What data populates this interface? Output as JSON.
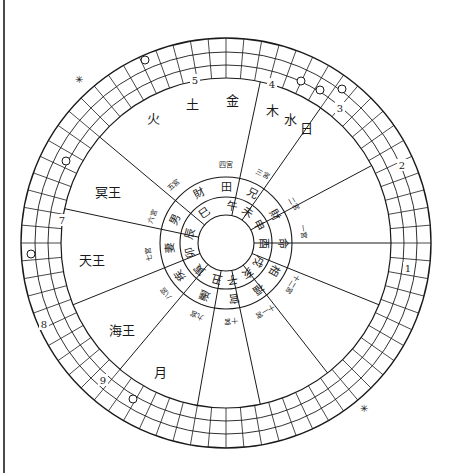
{
  "chart": {
    "title": "",
    "center": {
      "x": 226,
      "y": 243
    },
    "radii": {
      "hole": 28,
      "branch_ring": 46,
      "palace_ring": 66,
      "grid_inner": 165,
      "grid_mid1": 178,
      "grid_mid2": 191,
      "grid_outer": 205
    },
    "grid_divisions": 72,
    "spoke_angles_deg": [
      -78,
      -55,
      -28,
      0,
      22,
      52,
      78,
      100,
      130,
      158,
      192,
      220
    ],
    "branches": [
      {
        "label": "午",
        "angle": -80
      },
      {
        "label": "未",
        "angle": -55
      },
      {
        "label": "申",
        "angle": -28
      },
      {
        "label": "酉",
        "angle": 0
      },
      {
        "label": "戌",
        "angle": 30
      },
      {
        "label": "亥",
        "angle": 55
      },
      {
        "label": "子",
        "angle": 80
      },
      {
        "label": "丑",
        "angle": 105
      },
      {
        "label": "寅",
        "angle": 135
      },
      {
        "label": "卯",
        "angle": 165
      },
      {
        "label": "辰",
        "angle": 195
      },
      {
        "label": "巳",
        "angle": 235
      }
    ],
    "palaces": [
      {
        "label": "命",
        "angle": 0
      },
      {
        "label": "相",
        "angle": 30
      },
      {
        "label": "福",
        "angle": 55
      },
      {
        "label": "官",
        "angle": 82
      },
      {
        "label": "遷",
        "angle": 112
      },
      {
        "label": "疾",
        "angle": 145
      },
      {
        "label": "妻",
        "angle": 175
      },
      {
        "label": "男",
        "angle": 205
      },
      {
        "label": "財",
        "angle": -118
      },
      {
        "label": "田",
        "angle": -90
      },
      {
        "label": "兄",
        "angle": -62
      },
      {
        "label": "財",
        "angle": -30
      }
    ],
    "house_numbers": [
      {
        "label": "一宮",
        "angle": -8
      },
      {
        "label": "十二宮",
        "angle": 32
      },
      {
        "label": "十一宮",
        "angle": 60
      },
      {
        "label": "十宮",
        "angle": 86
      },
      {
        "label": "九宮",
        "angle": 112
      },
      {
        "label": "八宮",
        "angle": 140
      },
      {
        "label": "七宮",
        "angle": 172
      },
      {
        "label": "六宮",
        "angle": 200
      },
      {
        "label": "五宮",
        "angle": 228
      },
      {
        "label": "四宮",
        "angle": -90
      },
      {
        "label": "三宮",
        "angle": -62
      },
      {
        "label": "二宮",
        "angle": -30
      }
    ],
    "planets": [
      {
        "label": "火",
        "x": 153,
        "y": 118
      },
      {
        "label": "土",
        "x": 192,
        "y": 104
      },
      {
        "label": "金",
        "x": 232,
        "y": 100
      },
      {
        "label": "木",
        "x": 272,
        "y": 110
      },
      {
        "label": "水",
        "x": 290,
        "y": 119
      },
      {
        "label": "日",
        "x": 306,
        "y": 128
      },
      {
        "label": "冥王",
        "x": 108,
        "y": 192
      },
      {
        "label": "天王",
        "x": 92,
        "y": 260
      },
      {
        "label": "海王",
        "x": 122,
        "y": 330
      },
      {
        "label": "月",
        "x": 160,
        "y": 372
      }
    ],
    "grid_numbers": [
      {
        "label": "5",
        "x": 195,
        "y": 80
      },
      {
        "label": "4",
        "x": 272,
        "y": 84
      },
      {
        "label": "3",
        "x": 340,
        "y": 108
      },
      {
        "label": "2",
        "x": 402,
        "y": 165
      },
      {
        "label": "7",
        "x": 62,
        "y": 220
      },
      {
        "label": "8",
        "x": 44,
        "y": 324
      },
      {
        "label": "9",
        "x": 103,
        "y": 380
      },
      {
        "label": "1",
        "x": 408,
        "y": 268
      }
    ],
    "planet_circles": [
      {
        "x": 145,
        "y": 60
      },
      {
        "x": 301,
        "y": 81
      },
      {
        "x": 320,
        "y": 90
      },
      {
        "x": 342,
        "y": 89
      },
      {
        "x": 66,
        "y": 161
      },
      {
        "x": 31,
        "y": 254
      },
      {
        "x": 133,
        "y": 399
      }
    ],
    "stars": [
      {
        "x": 79,
        "y": 79
      },
      {
        "x": 364,
        "y": 408
      }
    ]
  }
}
